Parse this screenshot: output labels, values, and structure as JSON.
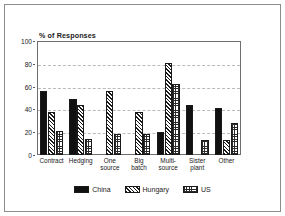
{
  "chart_data": {
    "type": "bar",
    "title": "% of Responses",
    "xlabel": "",
    "ylabel": "",
    "ylim": [
      0,
      100
    ],
    "yticks": [
      0,
      20,
      40,
      60,
      80,
      100
    ],
    "grid": true,
    "legend_position": "bottom",
    "categories": [
      "Contract",
      "Hedging",
      "One\nsource",
      "Big\nbatch",
      "Multi-\nsource",
      "Sister\nplant",
      "Other"
    ],
    "series": [
      {
        "name": "China",
        "color": "#111111",
        "pattern": "solid",
        "values": [
          56,
          49,
          0,
          0,
          20,
          44,
          41
        ]
      },
      {
        "name": "Hungary",
        "color": "#1a1a1a",
        "pattern": "diagonal",
        "values": [
          38,
          44,
          56,
          38,
          81,
          0,
          13
        ]
      },
      {
        "name": "US",
        "color": "#2b2b2b",
        "pattern": "crosshatch",
        "values": [
          21,
          14,
          18,
          18,
          62,
          13,
          28
        ]
      }
    ]
  },
  "legend": {
    "entries": [
      {
        "label": "China"
      },
      {
        "label": "Hungary"
      },
      {
        "label": "US"
      }
    ]
  }
}
